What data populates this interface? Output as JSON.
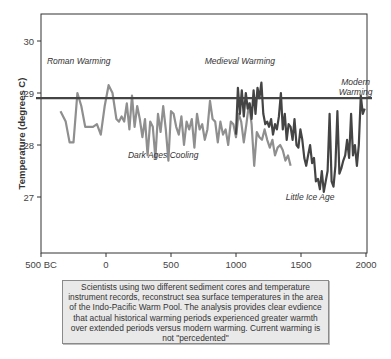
{
  "chart_data": {
    "type": "line",
    "title": "",
    "xlabel": "",
    "ylabel": "Temperature (degrees C)",
    "xlim": [
      -500,
      2000
    ],
    "ylim": [
      26,
      30.5
    ],
    "grid": false,
    "x_ticks": [
      {
        "value": -500,
        "label": "500 BC"
      },
      {
        "value": 0,
        "label": "0"
      },
      {
        "value": 500,
        "label": "500"
      },
      {
        "value": 1000,
        "label": "1000"
      },
      {
        "value": 1500,
        "label": "1500"
      },
      {
        "value": 2000,
        "label": "2000"
      }
    ],
    "y_ticks": [
      27,
      28,
      29,
      30
    ],
    "reference_line": {
      "y": 28.9,
      "color": "#444444",
      "label": "modern reference level"
    },
    "annotations": [
      {
        "text": "Roman Warming",
        "x": -210,
        "y": 29.55
      },
      {
        "text": "Medieval Warming",
        "x": 1030,
        "y": 29.55
      },
      {
        "text": "Modern Warming",
        "x": 1920,
        "y": 29.15
      },
      {
        "text": "Dark Ages Cooling",
        "x": 440,
        "y": 27.75
      },
      {
        "text": "Little Ice Age",
        "x": 1570,
        "y": 26.95
      }
    ],
    "series": [
      {
        "name": "Sediment core 1",
        "color": "#8f8f8f",
        "x": [
          -350,
          -310,
          -280,
          -250,
          -220,
          -190,
          -160,
          -130,
          -100,
          -70,
          -40,
          -10,
          20,
          50,
          80,
          100,
          120,
          140,
          160,
          180,
          200,
          220,
          240,
          260,
          280,
          300,
          320,
          340,
          360,
          380,
          400,
          420,
          440,
          460,
          480,
          500,
          520,
          540,
          560,
          580,
          600,
          620,
          640,
          660,
          680,
          700,
          720,
          740,
          760,
          780,
          800,
          820,
          840,
          860,
          880,
          900,
          920,
          940,
          960,
          980,
          1000,
          1020,
          1040,
          1060,
          1080,
          1100,
          1120,
          1140,
          1160,
          1180,
          1200,
          1220,
          1240,
          1260,
          1280,
          1300,
          1320,
          1340,
          1360,
          1380,
          1400,
          1420
        ],
        "values": [
          28.65,
          28.45,
          28.05,
          28.05,
          29.0,
          28.75,
          28.35,
          28.35,
          28.35,
          28.4,
          28.2,
          28.75,
          29.15,
          29.0,
          28.5,
          28.45,
          28.55,
          28.45,
          28.8,
          28.3,
          28.95,
          28.35,
          28.75,
          28.5,
          28.15,
          28.5,
          27.8,
          28.45,
          28.35,
          27.75,
          28.6,
          28.25,
          28.75,
          28.3,
          27.7,
          28.65,
          28.6,
          28.35,
          28.2,
          28.55,
          28.0,
          28.45,
          28.3,
          28.5,
          27.95,
          28.6,
          28.3,
          28.4,
          28.1,
          28.3,
          28.85,
          28.5,
          28.45,
          28.05,
          28.45,
          28.2,
          28.3,
          28.0,
          28.45,
          28.4,
          28.15,
          28.6,
          28.45,
          28.05,
          28.4,
          28.8,
          28.4,
          27.6,
          28.25,
          28.15,
          28.1,
          28.3,
          28.1,
          27.95,
          28.1,
          27.8,
          27.95,
          28.0,
          27.9,
          27.7,
          27.8,
          27.6
        ]
      },
      {
        "name": "Sediment core 2",
        "color": "#444444",
        "x": [
          1000,
          1015,
          1030,
          1045,
          1060,
          1075,
          1090,
          1105,
          1120,
          1135,
          1150,
          1165,
          1180,
          1195,
          1210,
          1225,
          1240,
          1255,
          1270,
          1285,
          1300,
          1315,
          1330,
          1345,
          1360,
          1375,
          1390,
          1405,
          1420,
          1435,
          1450,
          1465,
          1480,
          1495,
          1510,
          1525,
          1540,
          1555,
          1570,
          1585,
          1600,
          1615,
          1630,
          1645,
          1660,
          1675,
          1690,
          1705,
          1720,
          1735,
          1750,
          1765,
          1780,
          1795,
          1810,
          1825,
          1840,
          1855,
          1870,
          1885,
          1900,
          1915,
          1930,
          1945,
          1960,
          1975,
          1990
        ],
        "values": [
          28.2,
          29.1,
          28.6,
          29.05,
          28.55,
          29.0,
          28.7,
          28.8,
          28.5,
          29.05,
          28.6,
          29.1,
          28.9,
          29.2,
          28.6,
          28.4,
          28.45,
          28.35,
          28.5,
          28.2,
          28.4,
          28.3,
          28.55,
          29.0,
          28.3,
          28.6,
          28.1,
          28.4,
          28.35,
          28.1,
          28.5,
          28.0,
          27.95,
          28.3,
          28.1,
          27.75,
          27.6,
          27.8,
          28.0,
          27.65,
          27.75,
          27.3,
          27.35,
          27.15,
          27.5,
          27.1,
          27.3,
          27.5,
          28.6,
          27.3,
          27.2,
          27.6,
          28.65,
          27.45,
          27.55,
          27.7,
          27.8,
          28.1,
          27.75,
          28.6,
          27.8,
          28.0,
          27.6,
          28.0,
          28.95,
          28.6,
          28.7
        ]
      }
    ]
  },
  "caption": {
    "text": "Scientists using two different sediment cores and temperature instrument records, reconstruct sea surface temperatures in the area of the Indo-Pacific Warm Pool. The analysis provides clear evdience that actual historical warming periods experienced greater warmth over extended periods versus modern warming. Current warming is not \"percedented\""
  }
}
